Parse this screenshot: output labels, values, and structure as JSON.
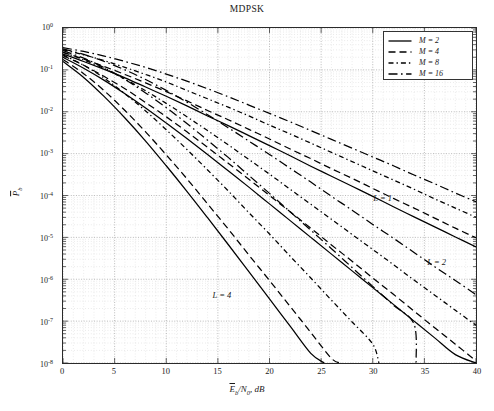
{
  "chart_data": {
    "type": "line",
    "title": "MDPSK",
    "xlabel": "Ēb/N0, dB",
    "ylabel": "P̄b",
    "xlim": [
      0,
      40
    ],
    "ylim_exp": [
      -8,
      0
    ],
    "grid": true,
    "xticks": [
      0,
      5,
      10,
      15,
      20,
      25,
      30,
      35,
      40
    ],
    "yticks": [
      "10^0",
      "10^-1",
      "10^-2",
      "10^-3",
      "10^-4",
      "10^-5",
      "10^-6",
      "10^-7",
      "10^-8"
    ],
    "legend_position": "top-right",
    "legend": [
      {
        "label": "M = 2",
        "dash": "solid"
      },
      {
        "label": "M = 4",
        "dash": "dashed"
      },
      {
        "label": "M = 8",
        "dash": "dashdot-short"
      },
      {
        "label": "M = 16",
        "dash": "dashdot"
      }
    ],
    "annotations": [
      {
        "text": "L = 1",
        "x": 30.0,
        "y_exp": -3.95
      },
      {
        "text": "L = 2",
        "x": 35.2,
        "y_exp": -5.45
      },
      {
        "text": "L = 4",
        "x": 14.5,
        "y_exp": -6.25
      }
    ],
    "series": [
      {
        "name": "L=1, M=2",
        "L": 1,
        "M": 2,
        "dash": "solid",
        "x": [
          0,
          2,
          4,
          6,
          8,
          10,
          12,
          14,
          16,
          18,
          20,
          22,
          24,
          26,
          28,
          30,
          32,
          34,
          36,
          38,
          40
        ],
        "y_exp": [
          -0.62,
          -0.8,
          -0.99,
          -1.19,
          -1.41,
          -1.63,
          -1.86,
          -2.1,
          -2.33,
          -2.57,
          -2.81,
          -3.05,
          -3.3,
          -3.54,
          -3.78,
          -4.02,
          -4.27,
          -4.51,
          -4.75,
          -4.99,
          -5.23
        ]
      },
      {
        "name": "L=1, M=4",
        "L": 1,
        "M": 4,
        "dash": "dashed",
        "x": [
          0,
          2,
          4,
          6,
          8,
          10,
          12,
          14,
          16,
          18,
          20,
          22,
          24,
          26,
          28,
          30,
          32,
          34,
          36,
          38,
          40
        ],
        "y_exp": [
          -0.58,
          -0.74,
          -0.92,
          -1.11,
          -1.31,
          -1.52,
          -1.74,
          -1.97,
          -2.19,
          -2.42,
          -2.65,
          -2.89,
          -3.12,
          -3.36,
          -3.59,
          -3.83,
          -4.07,
          -4.3,
          -4.54,
          -4.78,
          -5.01
        ]
      },
      {
        "name": "L=1, M=8",
        "L": 1,
        "M": 8,
        "dash": "dashdot-short",
        "x": [
          0,
          2,
          4,
          6,
          8,
          10,
          12,
          14,
          16,
          18,
          20,
          22,
          24,
          26,
          28,
          30,
          32,
          34,
          36,
          38,
          40
        ],
        "y_exp": [
          -0.52,
          -0.64,
          -0.78,
          -0.94,
          -1.11,
          -1.29,
          -1.49,
          -1.69,
          -1.89,
          -2.1,
          -2.32,
          -2.53,
          -2.75,
          -2.97,
          -3.19,
          -3.41,
          -3.63,
          -3.85,
          -4.08,
          -4.3,
          -4.52
        ]
      },
      {
        "name": "L=1, M=16",
        "L": 1,
        "M": 16,
        "dash": "dashdot",
        "x": [
          0,
          2,
          4,
          6,
          8,
          10,
          12,
          14,
          16,
          18,
          20,
          22,
          24,
          26,
          28,
          30,
          32,
          34,
          36,
          38,
          40
        ],
        "y_exp": [
          -0.47,
          -0.56,
          -0.67,
          -0.8,
          -0.94,
          -1.1,
          -1.27,
          -1.45,
          -1.64,
          -1.84,
          -2.04,
          -2.24,
          -2.45,
          -2.66,
          -2.87,
          -3.08,
          -3.29,
          -3.51,
          -3.72,
          -3.94,
          -4.15
        ]
      },
      {
        "name": "L=2, M=2",
        "L": 2,
        "M": 2,
        "dash": "solid",
        "x": [
          0,
          2,
          4,
          6,
          8,
          10,
          12,
          14,
          16,
          18,
          20,
          22,
          24,
          26,
          28,
          30,
          32,
          34,
          36,
          38,
          40
        ],
        "y_exp": [
          -0.7,
          -0.96,
          -1.25,
          -1.57,
          -1.91,
          -2.27,
          -2.64,
          -3.02,
          -3.41,
          -3.8,
          -4.2,
          -4.6,
          -5.0,
          -5.4,
          -5.8,
          -6.2,
          -6.6,
          -7.0,
          -7.4,
          -7.8,
          -8.0
        ]
      },
      {
        "name": "L=2, M=4",
        "L": 2,
        "M": 4,
        "dash": "dashed",
        "x": [
          0,
          2,
          4,
          6,
          8,
          10,
          12,
          14,
          16,
          18,
          20,
          22,
          24,
          26,
          28,
          30,
          32,
          34,
          36,
          38,
          40
        ],
        "y_exp": [
          -0.66,
          -0.89,
          -1.16,
          -1.45,
          -1.78,
          -2.12,
          -2.48,
          -2.85,
          -3.23,
          -3.61,
          -4.0,
          -4.39,
          -4.78,
          -5.18,
          -5.57,
          -5.97,
          -6.36,
          -6.76,
          -7.16,
          -7.55,
          -7.95
        ]
      },
      {
        "name": "L=2, M=8",
        "L": 2,
        "M": 8,
        "dash": "dashdot-short",
        "x": [
          0,
          2,
          4,
          6,
          8,
          10,
          12,
          14,
          16,
          18,
          20,
          22,
          24,
          26,
          28,
          30,
          32,
          34,
          36,
          38,
          40
        ],
        "y_exp": [
          -0.58,
          -0.76,
          -0.97,
          -1.22,
          -1.5,
          -1.8,
          -2.12,
          -2.45,
          -2.79,
          -3.14,
          -3.49,
          -3.85,
          -4.21,
          -4.57,
          -4.93,
          -5.29,
          -5.65,
          -6.02,
          -6.38,
          -6.74,
          -7.1
        ]
      },
      {
        "name": "L=2, M=16",
        "L": 2,
        "M": 16,
        "dash": "dashdot",
        "x": [
          0,
          2,
          4,
          6,
          8,
          10,
          12,
          14,
          16,
          18,
          20,
          22,
          24,
          26,
          28,
          30,
          32,
          34,
          36,
          38,
          40
        ],
        "y_exp": [
          -0.5,
          -0.63,
          -0.8,
          -1.0,
          -1.23,
          -1.49,
          -1.77,
          -2.07,
          -2.38,
          -2.7,
          -3.02,
          -3.35,
          -3.68,
          -4.02,
          -4.35,
          -4.69,
          -5.02,
          -5.36,
          -5.7,
          -6.03,
          -6.37
        ]
      },
      {
        "name": "L=4, M=2",
        "L": 4,
        "M": 2,
        "dash": "solid",
        "x": [
          0,
          2,
          4,
          6,
          8,
          10,
          12,
          14,
          16,
          18,
          20,
          22,
          24,
          25.3
        ],
        "y_exp": [
          -0.8,
          -1.18,
          -1.64,
          -2.15,
          -2.7,
          -3.29,
          -3.9,
          -4.53,
          -5.17,
          -5.82,
          -6.47,
          -7.12,
          -7.77,
          -8.0
        ]
      },
      {
        "name": "L=4, M=4",
        "L": 4,
        "M": 4,
        "dash": "dashed",
        "x": [
          0,
          2,
          4,
          6,
          8,
          10,
          12,
          14,
          16,
          18,
          20,
          22,
          24,
          26,
          26.9
        ],
        "y_exp": [
          -0.75,
          -1.09,
          -1.5,
          -1.97,
          -2.48,
          -3.03,
          -3.6,
          -4.2,
          -4.8,
          -5.42,
          -6.03,
          -6.65,
          -7.27,
          -7.89,
          -8.0
        ]
      },
      {
        "name": "L=4, M=8",
        "L": 4,
        "M": 8,
        "dash": "dashdot-short",
        "x": [
          0,
          2,
          4,
          6,
          8,
          10,
          12,
          14,
          16,
          18,
          20,
          22,
          24,
          26,
          28,
          30,
          30.6
        ],
        "y_exp": [
          -0.64,
          -0.89,
          -1.2,
          -1.57,
          -1.98,
          -2.43,
          -2.9,
          -3.39,
          -3.89,
          -4.41,
          -4.92,
          -5.45,
          -5.97,
          -6.5,
          -7.02,
          -7.55,
          -8.0
        ]
      },
      {
        "name": "L=4, M=16",
        "L": 4,
        "M": 16,
        "dash": "dashdot",
        "x": [
          0,
          2,
          4,
          6,
          8,
          10,
          12,
          14,
          16,
          18,
          20,
          22,
          24,
          26,
          28,
          30,
          32,
          34,
          34.2
        ],
        "y_exp": [
          -0.54,
          -0.72,
          -0.95,
          -1.23,
          -1.55,
          -1.9,
          -2.28,
          -2.68,
          -3.09,
          -3.52,
          -3.95,
          -4.39,
          -4.83,
          -5.27,
          -5.72,
          -6.17,
          -6.62,
          -7.07,
          -8.0
        ]
      }
    ]
  }
}
